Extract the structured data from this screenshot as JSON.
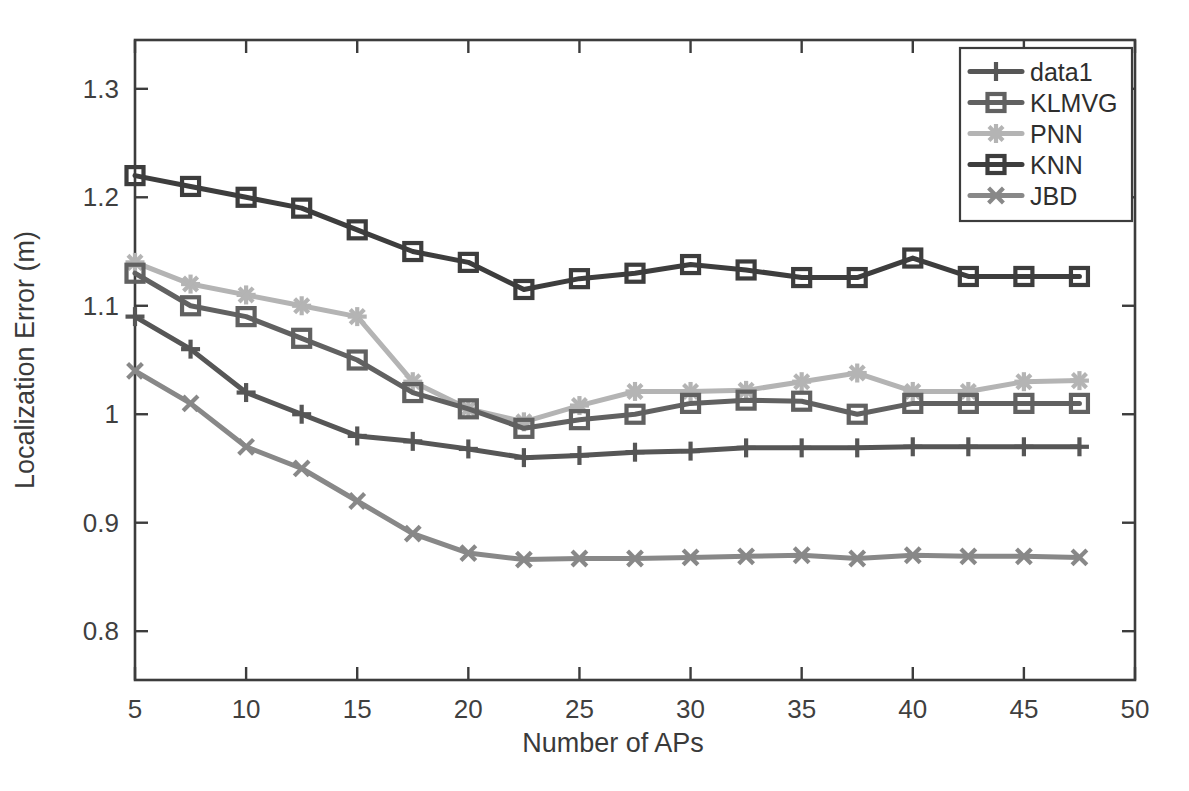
{
  "figure": {
    "background": "#ffffff",
    "plot_frame_color": "#3c3c3c"
  },
  "chart_data": {
    "type": "line",
    "title": "",
    "xlabel": "Number of APs",
    "ylabel": "Localization Error (m)",
    "xlim": [
      5,
      50
    ],
    "ylim": [
      0.755,
      1.345
    ],
    "xticks": [
      5,
      10,
      15,
      20,
      25,
      30,
      35,
      40,
      45,
      50
    ],
    "xticklabels": [
      "5",
      "10",
      "15",
      "20",
      "25",
      "30",
      "35",
      "40",
      "45",
      "50"
    ],
    "yticks": [
      0.8,
      0.9,
      1.0,
      1.1,
      1.2,
      1.3
    ],
    "yticklabels": [
      "0.8",
      "0.9",
      "1",
      "1.1",
      "1.2",
      "1.3"
    ],
    "grid": false,
    "legend_position": "upper right",
    "x": [
      5,
      7.5,
      10,
      12.5,
      15,
      17.5,
      20,
      22.5,
      25,
      27.5,
      30,
      32.5,
      35,
      37.5,
      40,
      42.5,
      45,
      47.5
    ],
    "series": [
      {
        "name": "data1",
        "marker": "plus",
        "color": "#565656",
        "values": [
          1.09,
          1.06,
          1.02,
          1.0,
          0.98,
          0.975,
          0.968,
          0.96,
          0.962,
          0.965,
          0.966,
          0.969,
          0.969,
          0.969,
          0.97,
          0.97,
          0.97,
          0.97
        ]
      },
      {
        "name": "KLMVG",
        "marker": "square",
        "color": "#616161",
        "values": [
          1.13,
          1.1,
          1.09,
          1.07,
          1.05,
          1.02,
          1.005,
          0.987,
          0.995,
          1.0,
          1.01,
          1.013,
          1.012,
          1.0,
          1.01,
          1.01,
          1.01,
          1.01
        ]
      },
      {
        "name": "PNN",
        "marker": "star",
        "color": "#b4b4b4",
        "values": [
          1.14,
          1.12,
          1.11,
          1.1,
          1.09,
          1.03,
          1.005,
          0.993,
          1.008,
          1.021,
          1.021,
          1.022,
          1.03,
          1.038,
          1.021,
          1.021,
          1.03,
          1.031
        ]
      },
      {
        "name": "KNN",
        "marker": "square",
        "color": "#3d3d3d",
        "values": [
          1.22,
          1.21,
          1.2,
          1.19,
          1.17,
          1.15,
          1.14,
          1.115,
          1.125,
          1.13,
          1.138,
          1.133,
          1.126,
          1.126,
          1.144,
          1.127,
          1.127,
          1.127
        ]
      },
      {
        "name": "JBD",
        "marker": "cross",
        "color": "#888888",
        "values": [
          1.04,
          1.01,
          0.97,
          0.95,
          0.92,
          0.89,
          0.872,
          0.866,
          0.867,
          0.867,
          0.868,
          0.869,
          0.87,
          0.867,
          0.87,
          0.869,
          0.869,
          0.868
        ]
      }
    ]
  },
  "legend": {
    "entries": [
      {
        "label": "data1"
      },
      {
        "label": "KLMVG"
      },
      {
        "label": "PNN"
      },
      {
        "label": "KNN"
      },
      {
        "label": "JBD"
      }
    ]
  }
}
